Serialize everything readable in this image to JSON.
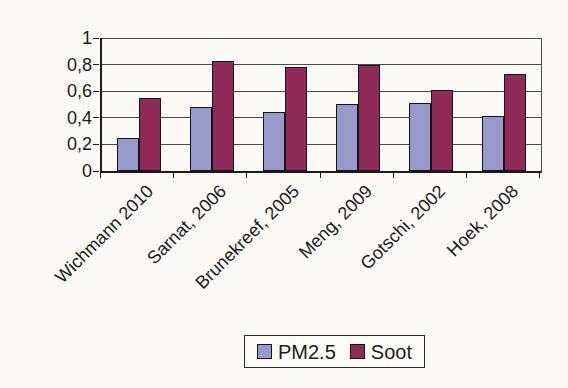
{
  "chart_data": {
    "type": "bar",
    "title": "",
    "xlabel": "",
    "ylabel": "",
    "categories": [
      "Wichmann 2010",
      "Sarnat, 2006",
      "Brunekreef, 2005",
      "Meng, 2009",
      "Gotschi, 2002",
      "Hoek, 2008"
    ],
    "series": [
      {
        "name": "PM2.5",
        "color": "#9999cc",
        "values": [
          0.25,
          0.48,
          0.44,
          0.5,
          0.51,
          0.41
        ]
      },
      {
        "name": "Soot",
        "color": "#8e2a55",
        "values": [
          0.55,
          0.83,
          0.78,
          0.8,
          0.61,
          0.73
        ]
      }
    ],
    "ylim": [
      0,
      1
    ],
    "yticks": [
      0,
      0.2,
      0.4,
      0.6,
      0.8,
      1
    ],
    "ytick_labels": [
      "0",
      "0,2",
      "0,4",
      "0,6",
      "0,8",
      "1"
    ],
    "grid": true,
    "legend_position": "bottom"
  },
  "legend": {
    "items": [
      {
        "label": "PM2.5",
        "color": "#9999cc"
      },
      {
        "label": "Soot",
        "color": "#8e2a55"
      }
    ]
  }
}
